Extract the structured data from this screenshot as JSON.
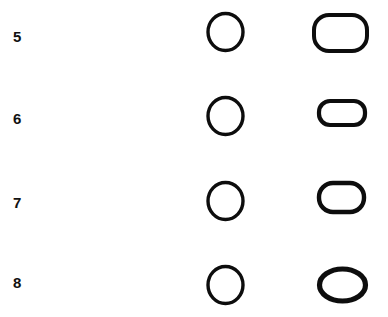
{
  "figure": {
    "background_color": "#ffffff",
    "ink_color": "#0d0d0d",
    "rows": [
      {
        "label": "5",
        "label_x": 13,
        "label_y": 29,
        "circle": {
          "name": "circle-outline-row-5",
          "cx": 225,
          "cy": 31.5,
          "rx": 17.5,
          "ry": 18.5,
          "stroke_width": 3.4
        },
        "shape": {
          "name": "rounded-rectangle-outline-row-5",
          "kind": "rounded-rect",
          "x": 314,
          "y": 15,
          "width": 53,
          "height": 36,
          "radius": 15,
          "stroke_width": 4.0
        }
      },
      {
        "label": "6",
        "label_x": 13,
        "label_y": 111,
        "circle": {
          "name": "circle-outline-row-6",
          "cx": 225,
          "cy": 115.5,
          "rx": 17.5,
          "ry": 18.5,
          "stroke_width": 3.4
        },
        "shape": {
          "name": "flat-stadium-outline-row-6",
          "kind": "rounded-rect",
          "x": 319,
          "y": 101,
          "width": 46,
          "height": 24,
          "radius": 11,
          "stroke_width": 4.2
        }
      },
      {
        "label": "7",
        "label_x": 13,
        "label_y": 195,
        "circle": {
          "name": "circle-outline-row-7",
          "cx": 225,
          "cy": 200.5,
          "rx": 17.5,
          "ry": 18.5,
          "stroke_width": 3.4
        },
        "shape": {
          "name": "wide-oval-outline-row-7",
          "kind": "rounded-rect",
          "x": 319,
          "y": 183,
          "width": 45,
          "height": 29,
          "radius": 14,
          "stroke_width": 4.4
        }
      },
      {
        "label": "8",
        "label_x": 13,
        "label_y": 275,
        "circle": {
          "name": "circle-outline-row-8",
          "cx": 225,
          "cy": 284.5,
          "rx": 17.5,
          "ry": 18.5,
          "stroke_width": 3.4
        },
        "shape": {
          "name": "ellipse-outline-row-8",
          "kind": "ellipse",
          "cx": 342,
          "cy": 285,
          "rx": 23,
          "ry": 16,
          "stroke_width": 5.2
        }
      }
    ]
  }
}
